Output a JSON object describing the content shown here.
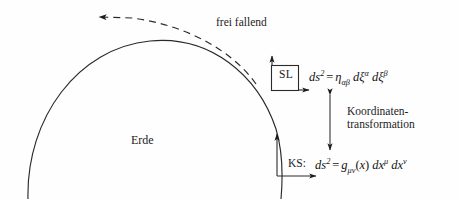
{
  "figure": {
    "background_color": "#fefefe",
    "ink_color": "#1c1c1c",
    "width": 461,
    "height": 199
  },
  "labels": {
    "free_fall": "frei fallend",
    "earth": "Erde",
    "coordinate_transformation_line1": "Koordinaten-",
    "coordinate_transformation_line2": "transformation",
    "sl_box": "SL",
    "ks_prefix": "KS:"
  },
  "formulas": {
    "sl": {
      "lhs_d": "d",
      "lhs_s": "s",
      "lhs_exp": "2",
      "equals": "=",
      "metric": "η",
      "metric_sub": "αβ",
      "term1_d": "d",
      "term1_var": "ξ",
      "term1_sup": "α",
      "term2_d": "d",
      "term2_var": "ξ",
      "term2_sup": "β",
      "plain": "ds² = ηαβ dξα dξβ"
    },
    "ks": {
      "lhs_d": "d",
      "lhs_s": "s",
      "lhs_exp": "2",
      "equals": "=",
      "metric": "g",
      "metric_sub": "μν",
      "arg_open": "(",
      "arg": "x",
      "arg_close": ")",
      "term1_d": "d",
      "term1_var": "x",
      "term1_sup": "μ",
      "term2_d": "d",
      "term2_var": "x",
      "term2_sup": "ν",
      "plain": "ds² = gμν(x) dxμ dxν"
    }
  },
  "graphics": {
    "earth_arc": "large circular arc representing the Earth surface",
    "free_fall_trajectory": "dashed arc with left-pointing arrowhead",
    "sl_frame_axes": "local inertial frame axes at SL box",
    "ks_frame_axes": "coordinate system axes on Earth surface",
    "transformation_arrow": "vertical double-headed arrow"
  }
}
